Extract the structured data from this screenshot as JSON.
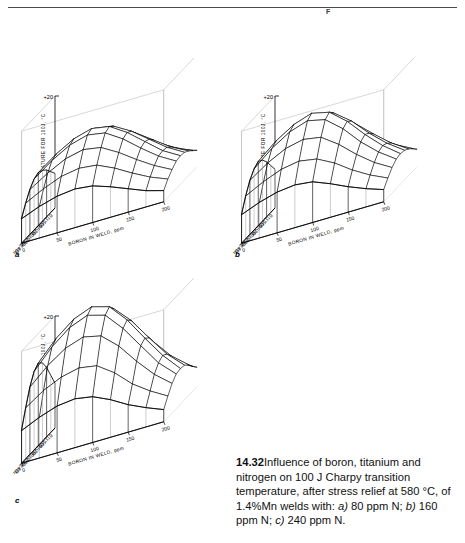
{
  "page": {
    "header_mark": "F",
    "header_ghost": ""
  },
  "caption": {
    "figure_number": "14.32",
    "text_1": "Influence of boron, titanium and nitrogen on 100 J Charpy transition temperature, after stress relief at 580 °C, of 1.4%Mn welds with: ",
    "a_marker": "a)",
    "text_2": " 80 ppm N; ",
    "b_marker": "b)",
    "text_3": " 160 ppm N; ",
    "c_marker": "c)",
    "text_4": " 240 ppm N."
  },
  "chart_data": [
    {
      "id": "a",
      "type": "surface",
      "panel_label": "a",
      "title": "",
      "condition": "80 ppm N",
      "zlabel": "TEMPERATURE FOR 100J, °C",
      "zticklabels": [
        "+20",
        "-90"
      ],
      "zlim": [
        -90,
        20
      ],
      "xlabel": "BORON IN WELD, ppm",
      "xticklabels": [
        "0",
        "50",
        "100",
        "150",
        "200"
      ],
      "x": [
        0,
        50,
        100,
        150,
        200
      ],
      "xlim": [
        0,
        200
      ],
      "ylabel": "TITANIUM IN WELD, ppm",
      "yticklabels": [
        "0",
        "100",
        "200",
        "300",
        "400"
      ],
      "y": [
        0,
        100,
        200,
        300,
        400
      ],
      "ylim": [
        0,
        400
      ],
      "grid": true,
      "legend": "none",
      "z": [
        [
          -56,
          -50,
          -46,
          -44,
          -46,
          -52,
          -60,
          -68,
          -74
        ],
        [
          -50,
          -42,
          -36,
          -33,
          -35,
          -42,
          -52,
          -62,
          -70
        ],
        [
          -44,
          -34,
          -26,
          -22,
          -24,
          -33,
          -45,
          -57,
          -66
        ],
        [
          -40,
          -28,
          -19,
          -14,
          -17,
          -27,
          -40,
          -53,
          -63
        ],
        [
          -38,
          -25,
          -15,
          -10,
          -13,
          -24,
          -38,
          -52,
          -62
        ],
        [
          -40,
          -27,
          -17,
          -12,
          -15,
          -26,
          -40,
          -53,
          -63
        ],
        [
          -46,
          -35,
          -26,
          -22,
          -25,
          -35,
          -47,
          -58,
          -67
        ],
        [
          -55,
          -46,
          -39,
          -36,
          -38,
          -46,
          -56,
          -65,
          -72
        ],
        [
          -66,
          -59,
          -54,
          -52,
          -54,
          -60,
          -67,
          -74,
          -79
        ]
      ]
    },
    {
      "id": "b",
      "type": "surface",
      "panel_label": "b",
      "title": "",
      "condition": "160 ppm N",
      "zlabel": "TEMPERATURE FOR 100J, °C",
      "zticklabels": [
        "+20",
        "-90"
      ],
      "zlim": [
        -90,
        20
      ],
      "xlabel": "BORON IN WELD, ppm",
      "xticklabels": [
        "0",
        "50",
        "100",
        "150",
        "200"
      ],
      "x": [
        0,
        50,
        100,
        150,
        200
      ],
      "xlim": [
        0,
        200
      ],
      "ylabel": "TITANIUM IN WELD, ppm",
      "yticklabels": [
        "0",
        "100",
        "200",
        "300",
        "400"
      ],
      "y": [
        0,
        100,
        200,
        300,
        400
      ],
      "ylim": [
        0,
        400
      ],
      "grid": true,
      "legend": "none",
      "z": [
        [
          -52,
          -45,
          -40,
          -37,
          -39,
          -46,
          -56,
          -66,
          -73
        ],
        [
          -44,
          -34,
          -27,
          -23,
          -25,
          -34,
          -47,
          -59,
          -68
        ],
        [
          -36,
          -24,
          -15,
          -10,
          -13,
          -24,
          -39,
          -53,
          -64
        ],
        [
          -30,
          -16,
          -6,
          0,
          -4,
          -17,
          -34,
          -49,
          -61
        ],
        [
          -27,
          -12,
          -1,
          5,
          1,
          -13,
          -31,
          -47,
          -60
        ],
        [
          -30,
          -15,
          -4,
          2,
          -2,
          -16,
          -34,
          -49,
          -61
        ],
        [
          -37,
          -25,
          -16,
          -12,
          -15,
          -27,
          -42,
          -55,
          -65
        ],
        [
          -48,
          -39,
          -32,
          -29,
          -32,
          -41,
          -53,
          -63,
          -71
        ],
        [
          -62,
          -55,
          -50,
          -48,
          -50,
          -57,
          -65,
          -72,
          -78
        ]
      ]
    },
    {
      "id": "c",
      "type": "surface",
      "panel_label": "c",
      "title": "",
      "condition": "240 ppm N",
      "zlabel": "TEMPERATURE FOR 100J, °C",
      "zticklabels": [
        "+20",
        "-90"
      ],
      "zlim": [
        -90,
        20
      ],
      "xlabel": "BORON IN WELD, ppm",
      "xticklabels": [
        "0",
        "50",
        "100",
        "150",
        "200"
      ],
      "x": [
        0,
        50,
        100,
        150,
        200
      ],
      "xlim": [
        0,
        200
      ],
      "ylabel": "TITANIUM IN WELD, ppm",
      "yticklabels": [
        "0",
        "100",
        "200",
        "300",
        "400"
      ],
      "y": [
        0,
        100,
        200,
        300,
        400
      ],
      "ylim": [
        0,
        400
      ],
      "grid": true,
      "legend": "none",
      "z": [
        [
          -46,
          -36,
          -28,
          -24,
          -27,
          -37,
          -50,
          -62,
          -71
        ],
        [
          -34,
          -20,
          -9,
          -3,
          -7,
          -20,
          -38,
          -54,
          -66
        ],
        [
          -22,
          -5,
          7,
          14,
          9,
          -6,
          -27,
          -46,
          -60
        ],
        [
          -13,
          5,
          18,
          25,
          20,
          3,
          -19,
          -40,
          -56
        ],
        [
          -9,
          10,
          24,
          31,
          26,
          8,
          -15,
          -37,
          -55
        ],
        [
          -13,
          6,
          20,
          27,
          22,
          4,
          -18,
          -40,
          -56
        ],
        [
          -24,
          -8,
          4,
          10,
          6,
          -9,
          -29,
          -47,
          -61
        ],
        [
          -40,
          -28,
          -20,
          -16,
          -19,
          -31,
          -47,
          -59,
          -69
        ],
        [
          -58,
          -50,
          -44,
          -42,
          -45,
          -53,
          -63,
          -71,
          -78
        ]
      ]
    }
  ]
}
